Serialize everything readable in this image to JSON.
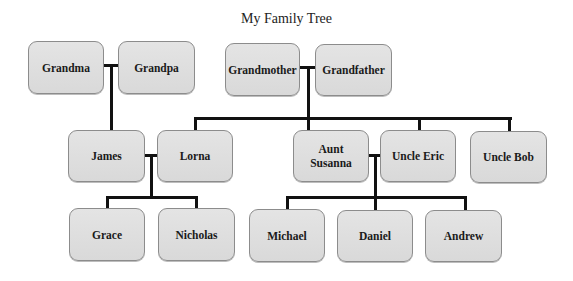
{
  "title": "My Family Tree",
  "colors": {
    "box_fill": "#dedede",
    "box_border": "#8c8c8c",
    "line": "#111111",
    "text": "#1a1a1a"
  },
  "people": {
    "grandma": "Grandma",
    "grandpa": "Grandpa",
    "grandmother": "Grandmother",
    "grandfather": "Grandfather",
    "james": "James",
    "lorna": "Lorna",
    "aunt_susanna": "Aunt\nSusanna",
    "uncle_eric": "Uncle Eric",
    "uncle_bob": "Uncle Bob",
    "grace": "Grace",
    "nicholas": "Nicholas",
    "michael": "Michael",
    "daniel": "Daniel",
    "andrew": "Andrew"
  },
  "relationships": [
    {
      "couple": [
        "Grandma",
        "Grandpa"
      ],
      "children": [
        "James"
      ]
    },
    {
      "couple": [
        "Grandmother",
        "Grandfather"
      ],
      "children": [
        "Lorna",
        "Aunt Susanna",
        "Uncle Eric",
        "Uncle Bob"
      ]
    },
    {
      "couple": [
        "James",
        "Lorna"
      ],
      "children": [
        "Grace",
        "Nicholas"
      ]
    },
    {
      "couple": [
        "Aunt Susanna",
        "Uncle Eric"
      ],
      "children": [
        "Michael",
        "Daniel",
        "Andrew"
      ]
    }
  ]
}
